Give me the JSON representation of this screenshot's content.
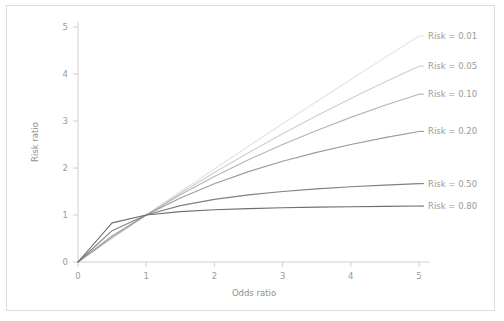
{
  "chart_data": {
    "type": "line",
    "title": "",
    "xlabel": "Odds ratio",
    "ylabel": "Risk ratio",
    "xlim": [
      0,
      5
    ],
    "ylim": [
      0,
      5
    ],
    "xticks": [
      0,
      1,
      2,
      3,
      4,
      5
    ],
    "yticks": [
      0,
      1,
      2,
      3,
      4,
      5
    ],
    "xticklabels": [
      "0",
      "1",
      "2",
      "3",
      "4",
      "5"
    ],
    "yticklabels": [
      "0",
      "1",
      "2",
      "3",
      "4",
      "5"
    ],
    "grid": false,
    "legend_position": "right-inline",
    "x": [
      0,
      0.5,
      1,
      1.5,
      2,
      2.5,
      3,
      3.5,
      4,
      4.5,
      5
    ],
    "series": [
      {
        "name": "Risk = 0.01",
        "risk": 0.01,
        "color": "#e3e3e3",
        "label": "Risk = 0.01",
        "values": [
          0,
          0.502,
          1,
          1.493,
          1.98,
          2.463,
          2.941,
          3.415,
          3.883,
          4.348,
          4.808
        ]
      },
      {
        "name": "Risk = 0.05",
        "risk": 0.05,
        "color": "#cfcfcf",
        "label": "Risk = 0.05",
        "values": [
          0,
          0.513,
          1,
          1.463,
          1.905,
          2.326,
          2.727,
          3.111,
          3.478,
          3.83,
          4.167
        ]
      },
      {
        "name": "Risk = 0.10",
        "risk": 0.1,
        "color": "#b4b4b4",
        "label": "Risk = 0.10",
        "values": [
          0,
          0.526,
          1,
          1.429,
          1.818,
          2.174,
          2.5,
          2.8,
          3.077,
          3.333,
          3.571
        ]
      },
      {
        "name": "Risk = 0.20",
        "risk": 0.2,
        "color": "#9b9b9b",
        "label": "Risk = 0.20",
        "values": [
          0,
          0.556,
          1,
          1.364,
          1.667,
          1.923,
          2.143,
          2.333,
          2.5,
          2.647,
          2.778
        ]
      },
      {
        "name": "Risk = 0.50",
        "risk": 0.5,
        "color": "#808080",
        "label": "Risk = 0.50",
        "values": [
          0,
          0.667,
          1,
          1.2,
          1.333,
          1.429,
          1.5,
          1.556,
          1.6,
          1.636,
          1.667
        ]
      },
      {
        "name": "Risk = 0.80",
        "risk": 0.8,
        "color": "#6e6e6e",
        "label": "Risk = 0.80",
        "values": [
          0,
          0.833,
          1,
          1.071,
          1.111,
          1.136,
          1.154,
          1.167,
          1.176,
          1.184,
          1.19
        ]
      }
    ],
    "legend_entries": [
      {
        "label": "Risk = 0.01",
        "color": "#e3e3e3"
      },
      {
        "label": "Risk = 0.05",
        "color": "#cfcfcf"
      },
      {
        "label": "Risk = 0.10",
        "color": "#b4b4b4"
      },
      {
        "label": "Risk = 0.20",
        "color": "#9b9b9b"
      },
      {
        "label": "Risk = 0.50",
        "color": "#808080"
      },
      {
        "label": "Risk = 0.80",
        "color": "#6e6e6e"
      }
    ]
  },
  "axes": {
    "x_title": "Odds ratio",
    "y_title": "Risk ratio",
    "x_tick_labels": [
      "0",
      "1",
      "2",
      "3",
      "4",
      "5"
    ],
    "y_tick_labels": [
      "0",
      "1",
      "2",
      "3",
      "4",
      "5"
    ]
  },
  "legend": {
    "labels": [
      "Risk = 0.01",
      "Risk = 0.05",
      "Risk = 0.10",
      "Risk = 0.20",
      "Risk = 0.50",
      "Risk = 0.80"
    ]
  },
  "style": {
    "background": "#ffffff",
    "frame_border": "#dcdcdc",
    "axis_color": "#c4c4c4",
    "text_color": "#9a9a9a"
  }
}
